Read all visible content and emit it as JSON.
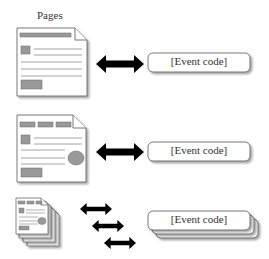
{
  "diagram": {
    "pages_label": "Pages",
    "rows": [
      {
        "page_type": "simple-page",
        "arrow": "bidirectional",
        "event_label": "[Event code]"
      },
      {
        "page_type": "page-with-tabs-and-circle",
        "arrow": "bidirectional",
        "event_label": "[Event code]"
      },
      {
        "page_type": "stacked-pages",
        "arrow": "multiple-bidirectional",
        "event_label": "[Event code]"
      }
    ],
    "colors": {
      "page_fill": "#ffffff",
      "page_stroke": "#555555",
      "block_fill": "#999999",
      "arrow_fill": "#000000",
      "box_stroke": "#555555"
    }
  }
}
